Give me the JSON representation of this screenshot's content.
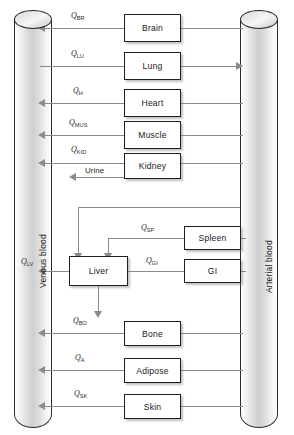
{
  "diagram": {
    "type": "pbpk-flow-diagram",
    "line_color": "#8b8b8b",
    "box_border_color": "#1f1f1f",
    "background": "#ffffff"
  },
  "compartments": {
    "venous": {
      "label": "Venous blood",
      "side": "left"
    },
    "arterial": {
      "label": "Arterial blood",
      "side": "right"
    }
  },
  "organs": [
    {
      "name": "Brain",
      "label": "Brain",
      "flow_symbol": "Q",
      "flow_subscript": "BR",
      "direction": "arterial-to-venous"
    },
    {
      "name": "Lung",
      "label": "Lung",
      "flow_symbol": "Q",
      "flow_subscript": "LU",
      "direction": "venous-to-arterial"
    },
    {
      "name": "Heart",
      "label": "Heart",
      "flow_symbol": "Q",
      "flow_subscript": "H",
      "direction": "arterial-to-venous"
    },
    {
      "name": "Muscle",
      "label": "Muscle",
      "flow_symbol": "Q",
      "flow_subscript": "MUS",
      "direction": "arterial-to-venous"
    },
    {
      "name": "Kidney",
      "label": "Kidney",
      "flow_symbol": "Q",
      "flow_subscript": "KID",
      "direction": "arterial-to-venous"
    },
    {
      "name": "Spleen",
      "label": "Spleen",
      "flow_symbol": "Q",
      "flow_subscript": "SP",
      "direction": "arterial-to-liver"
    },
    {
      "name": "GI",
      "label": "GI",
      "flow_symbol": "Q",
      "flow_subscript": "GI",
      "direction": "arterial-to-liver"
    },
    {
      "name": "Liver",
      "label": "Liver",
      "flow_symbol": "Q",
      "flow_subscript": "LV",
      "direction": "liver-to-venous"
    },
    {
      "name": "Bone",
      "label": "Bone",
      "flow_symbol": "Q",
      "flow_subscript": "BO",
      "direction": "arterial-to-venous"
    },
    {
      "name": "Adipose",
      "label": "Adipose",
      "flow_symbol": "Q",
      "flow_subscript": "A",
      "direction": "arterial-to-venous"
    },
    {
      "name": "Skin",
      "label": "Skin",
      "flow_symbol": "Q",
      "flow_subscript": "SK",
      "direction": "arterial-to-venous"
    }
  ],
  "elimination": [
    {
      "label": "Urine",
      "source": "Kidney",
      "direction": "left"
    },
    {
      "label": "",
      "source": "Liver",
      "direction": "down"
    }
  ]
}
